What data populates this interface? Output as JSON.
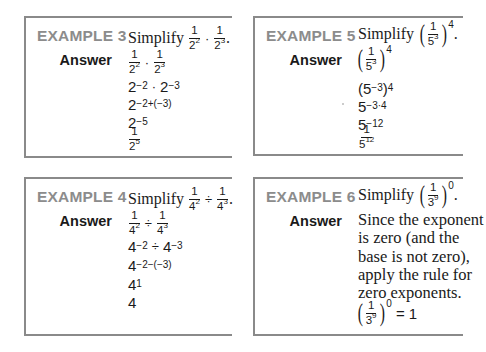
{
  "examples": [
    {
      "label": "EXAMPLE 3",
      "prompt_word": "Simplify",
      "problem": "1/2^2 · 1/2^3",
      "answer_label": "Answer",
      "steps": [
        "1/2^2 · 1/2^3",
        "2^-2 · 2^-3",
        "2^-2+(-3)",
        "2^-5",
        "1/2^5"
      ]
    },
    {
      "label": "EXAMPLE 5",
      "prompt_word": "Simplify",
      "problem": "(1/5^3)^4",
      "answer_label": "Answer",
      "steps": [
        "(1/5^3)^4",
        "(5^-3)^4",
        "5^-3·4",
        "5^-12",
        "1/5^12"
      ]
    },
    {
      "label": "EXAMPLE 4",
      "prompt_word": "Simplify",
      "problem": "1/4^2 ÷ 1/4^3",
      "answer_label": "Answer",
      "steps": [
        "1/4^2 ÷ 1/4^3",
        "4^-2 ÷ 4^-3",
        "4^-2-(-3)",
        "4^1",
        "4"
      ]
    },
    {
      "label": "EXAMPLE 6",
      "prompt_word": "Simplify",
      "problem": "(1/3^9)^0",
      "answer_label": "Answer",
      "explanation_lines": [
        "Since the exponent",
        "is zero (and the",
        "base is not zero),",
        "apply the rule for",
        "zero exponents."
      ],
      "result": "(1/3^9)^0 = 1"
    }
  ],
  "sym": {
    "one": "1",
    "two": "2",
    "three": "3",
    "four": "4",
    "five": "5",
    "nine": "9",
    "dot": "·",
    "div": "÷",
    "period": ".",
    "eq": "= 1",
    "e2": "2",
    "e3": "3",
    "e4": "4",
    "e0": "0",
    "e5": "5",
    "e12": "12",
    "e1": "1",
    "m2": "−2",
    "m3": "−3",
    "m5": "−5",
    "m12": "−12",
    "m34": "−3·4",
    "m2pm3": "−2+(−3)",
    "m2mm3": "−2−(−3)",
    "lp": "(",
    "rp": ")"
  },
  "colors": {
    "label_gray": "#8c8c8c",
    "border_gray": "#8a8a8a",
    "text": "#1a1a1a"
  }
}
